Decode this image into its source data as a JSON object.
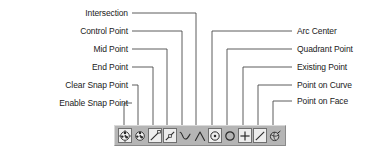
{
  "diagram": {
    "toolbar_name": "snap-point-toolbar",
    "colors": {
      "toolbar_background": "#b5b5b5",
      "button_face": "#ededed",
      "leader_line": "#4a4a4a",
      "text": "#1a1a1a",
      "icon_stroke": "#2b2b2b"
    }
  },
  "labels_left": [
    {
      "id": "intersection",
      "text": "Intersection",
      "y": 13,
      "text_right": 128,
      "elbow_x": 196
    },
    {
      "id": "control-point",
      "text": "Control Point",
      "y": 31,
      "text_right": 128,
      "elbow_x": 182
    },
    {
      "id": "mid-point",
      "text": "Mid Point",
      "y": 49,
      "text_right": 128,
      "elbow_x": 167
    },
    {
      "id": "end-point",
      "text": "End Point",
      "y": 67,
      "text_right": 128,
      "elbow_x": 153
    },
    {
      "id": "clear-snap-point",
      "text": "Clear Snap Point",
      "y": 85,
      "text_right": 128,
      "elbow_x": 138
    },
    {
      "id": "enable-snap-point",
      "text": "Enable Snap Point",
      "y": 103,
      "text_right": 128,
      "elbow_x": 124
    }
  ],
  "labels_right": [
    {
      "id": "arc-center",
      "text": "Arc Center",
      "y": 31,
      "text_left": 297,
      "elbow_x": 212
    },
    {
      "id": "quadrant-point",
      "text": "Quadrant Point",
      "y": 49,
      "text_left": 297,
      "elbow_x": 227
    },
    {
      "id": "existing-point",
      "text": "Existing Point",
      "y": 67,
      "text_left": 297,
      "elbow_x": 243
    },
    {
      "id": "point-on-curve",
      "text": "Point on Curve",
      "y": 85,
      "text_left": 297,
      "elbow_x": 258
    },
    {
      "id": "point-on-face",
      "text": "Point on Face",
      "y": 101,
      "text_left": 297,
      "elbow_x": 273
    }
  ],
  "toolbar_buttons": [
    {
      "id": "enable-snap-point",
      "icon": "snap-ball-icon",
      "label": "Enable Snap Point",
      "framed": true
    },
    {
      "id": "clear-snap-point",
      "icon": "snap-ball-clear-icon",
      "label": "Clear Snap Point",
      "framed": false
    },
    {
      "id": "end-point",
      "icon": "line-endpoint-icon",
      "label": "End Point",
      "framed": true
    },
    {
      "id": "mid-point",
      "icon": "line-midpoint-icon",
      "label": "Mid Point",
      "framed": true
    },
    {
      "id": "control-point",
      "icon": "spline-control-icon",
      "label": "Control Point",
      "framed": false
    },
    {
      "id": "intersection",
      "icon": "intersection-icon",
      "label": "Intersection",
      "framed": false
    },
    {
      "id": "arc-center",
      "icon": "arc-center-icon",
      "label": "Arc Center",
      "framed": true
    },
    {
      "id": "quadrant-point",
      "icon": "quadrant-point-icon",
      "label": "Quadrant Point",
      "framed": false
    },
    {
      "id": "existing-point",
      "icon": "existing-point-icon",
      "label": "Existing Point",
      "framed": true
    },
    {
      "id": "point-on-curve",
      "icon": "point-on-curve-icon",
      "label": "Point on Curve",
      "framed": true
    },
    {
      "id": "point-on-face",
      "icon": "point-on-face-icon",
      "label": "Point on Face",
      "framed": false
    }
  ]
}
